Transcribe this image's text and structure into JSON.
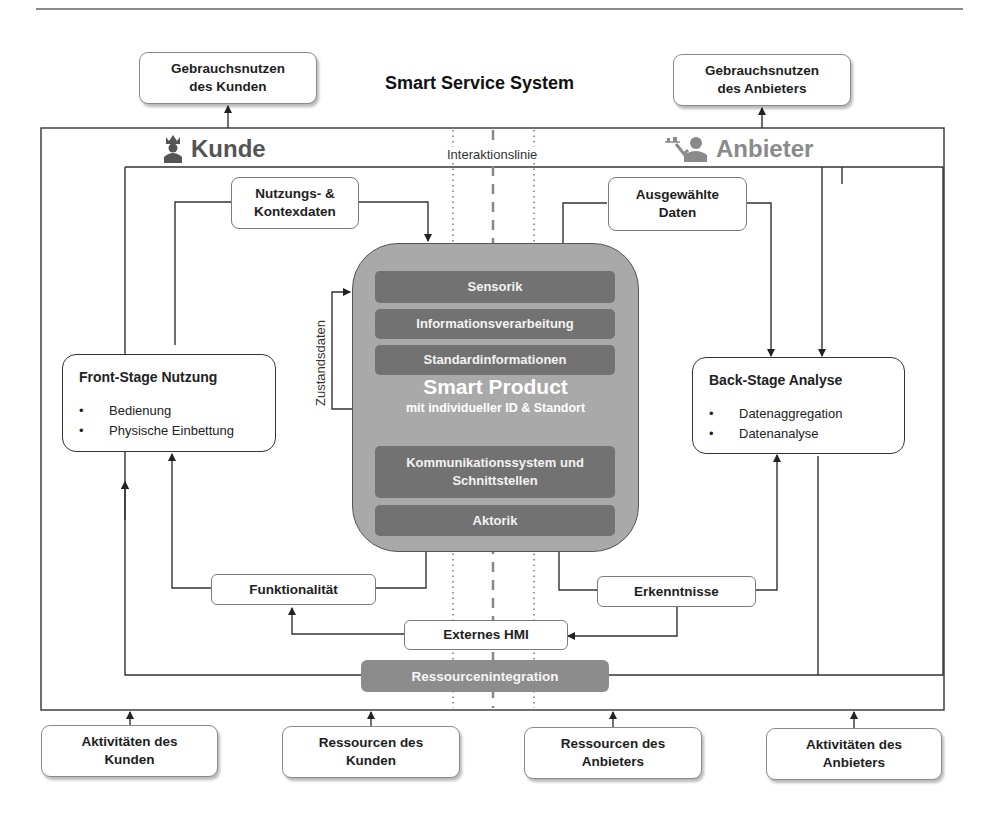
{
  "title": "Smart Service System",
  "top_boxes": {
    "customer_value": "Gebrauchsnutzen des Kunden",
    "provider_value": "Gebrauchsnutzen des Anbieters"
  },
  "actors": {
    "customer": {
      "label": "Kunde",
      "icon": "king-icon"
    },
    "provider": {
      "label": "Anbieter",
      "icon": "waiter-icon"
    }
  },
  "interaction_line_label": "Interaktionslinie",
  "data_boxes": {
    "usage_context": "Nutzungs- & Kontexdaten",
    "selected_data": "Ausgewählte Daten",
    "functionality": "Funktionalität",
    "insights": "Erkenntnisse",
    "external_hmi": "Externes HMI",
    "resource_integration": "Ressourcenintegration"
  },
  "state_data_label": "Zustandsdaten",
  "front_stage": {
    "title": "Front-Stage Nutzung",
    "items": [
      "Bedienung",
      "Physische Einbettung"
    ]
  },
  "back_stage": {
    "title": "Back-Stage Analyse",
    "items": [
      "Datenaggregation",
      "Datenanalyse"
    ]
  },
  "smart_product": {
    "title": "Smart Product",
    "subtitle": "mit individueller ID & Standort",
    "layers_top": [
      "Sensorik",
      "Informationsverarbeitung",
      "Standardinformationen"
    ],
    "layers_bottom": [
      "Kommunikationssystem und Schnittstellen",
      "Aktorik"
    ]
  },
  "bottom_boxes": [
    "Aktivitäten des Kunden",
    "Ressourcen des Kunden",
    "Ressourcen des Anbieters",
    "Aktivitäten des Anbieters"
  ],
  "colors": {
    "product_bg": "#a9a9a9",
    "layer_bg": "#727272",
    "resource_bg": "#8c8c8c",
    "line": "#333333",
    "provider_text": "#8a8a8a",
    "customer_text": "#555555"
  }
}
